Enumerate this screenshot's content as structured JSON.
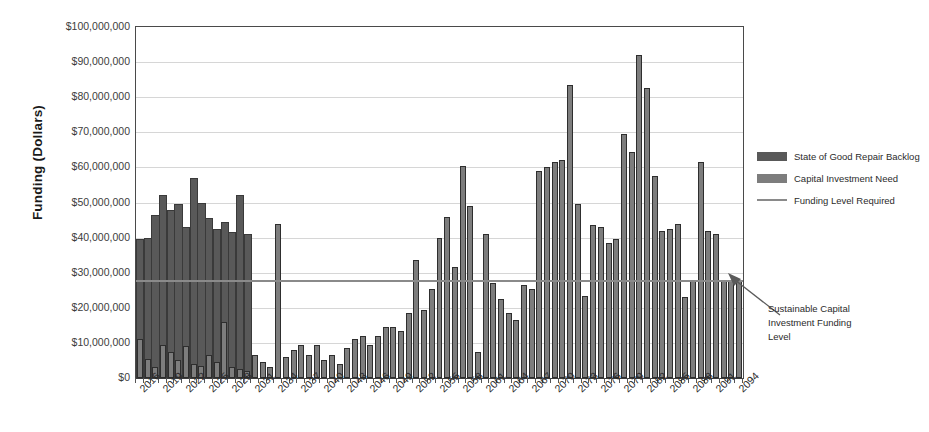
{
  "chart_data": {
    "type": "bar",
    "title": "",
    "xlabel": "",
    "ylabel": "Funding (Dollars)",
    "ylim": [
      0,
      100000000
    ],
    "grid": true,
    "legend_position": "right",
    "y_ticks": [
      "$100,000,000",
      "$90,000,000",
      "$80,000,000",
      "$70,000,000",
      "$60,000,000",
      "$50,000,000",
      "$40,000,000",
      "$30,000,000",
      "$20,000,000",
      "$10,000,000",
      "$0"
    ],
    "y_tick_values": [
      100000000,
      90000000,
      80000000,
      70000000,
      60000000,
      50000000,
      40000000,
      30000000,
      20000000,
      10000000,
      0
    ],
    "x_tick_labels": [
      "2016",
      "2019",
      "2022",
      "2025",
      "2028",
      "2031",
      "2034",
      "2037",
      "2040",
      "2043",
      "2046",
      "2049",
      "2052",
      "2055",
      "2058",
      "2061",
      "2064",
      "2067",
      "2070",
      "2073",
      "2076",
      "2079",
      "2082",
      "2085",
      "2088",
      "2091",
      "2094"
    ],
    "categories": [
      2016,
      2017,
      2018,
      2019,
      2020,
      2021,
      2022,
      2023,
      2024,
      2025,
      2026,
      2027,
      2028,
      2029,
      2030,
      2031,
      2032,
      2033,
      2034,
      2035,
      2036,
      2037,
      2038,
      2039,
      2040,
      2041,
      2042,
      2043,
      2044,
      2045,
      2046,
      2047,
      2048,
      2049,
      2050,
      2051,
      2052,
      2053,
      2054,
      2055,
      2056,
      2057,
      2058,
      2059,
      2060,
      2061,
      2062,
      2063,
      2064,
      2065,
      2066,
      2067,
      2068,
      2069,
      2070,
      2071,
      2072,
      2073,
      2074,
      2075,
      2076,
      2077,
      2078,
      2079,
      2080,
      2081,
      2082,
      2083,
      2084,
      2085,
      2086,
      2087,
      2088,
      2089,
      2090,
      2091,
      2092,
      2093,
      2094
    ],
    "series": [
      {
        "name": "State of Good Repair Backlog",
        "color": "#595959",
        "values": [
          39500000,
          40000000,
          46500000,
          52000000,
          48000000,
          49500000,
          43000000,
          57000000,
          50000000,
          45500000,
          42500000,
          44500000,
          41500000,
          52000000,
          41000000,
          0,
          0,
          0,
          0,
          0,
          0,
          0,
          0,
          0,
          0,
          0,
          0,
          0,
          0,
          0,
          0,
          0,
          0,
          0,
          0,
          0,
          0,
          0,
          0,
          0,
          0,
          0,
          0,
          0,
          0,
          0,
          0,
          0,
          0,
          0,
          0,
          0,
          0,
          0,
          0,
          0,
          0,
          0,
          0,
          0,
          0,
          0,
          0,
          0,
          0,
          0,
          0,
          0,
          0,
          0,
          0,
          0,
          0,
          0,
          0,
          0,
          0,
          0,
          0
        ]
      },
      {
        "name": "Capital Investment Need",
        "color": "#7d7d7d",
        "values": [
          11000000,
          5500000,
          3000000,
          9500000,
          7500000,
          5000000,
          9000000,
          4000000,
          3500000,
          6500000,
          4500000,
          16000000,
          3000000,
          2500000,
          2000000,
          6500000,
          4500000,
          3000000,
          44000000,
          6000000,
          8000000,
          9500000,
          6500000,
          9500000,
          5000000,
          6500000,
          4000000,
          8500000,
          11000000,
          12000000,
          9500000,
          12000000,
          14500000,
          14500000,
          13500000,
          18500000,
          33500000,
          19500000,
          25500000,
          40000000,
          46000000,
          31500000,
          60500000,
          49000000,
          7500000,
          41000000,
          27000000,
          22500000,
          18500000,
          16500000,
          26500000,
          25500000,
          59000000,
          60000000,
          61500000,
          62000000,
          83500000,
          49500000,
          23500000,
          43500000,
          43000000,
          38500000,
          39500000,
          69500000,
          64500000,
          92000000,
          82500000,
          57500000,
          42000000,
          42500000,
          44000000,
          23000000,
          28000000,
          61500000,
          42000000,
          41000000,
          28000000,
          28000000,
          27500000
        ]
      }
    ],
    "reference_line": {
      "name": "Funding Level Required",
      "value": 28000000,
      "color": "#8a8a8a"
    },
    "annotation": {
      "text": "Sustainable Capital Investment Funding Level",
      "lines": [
        "Sustainable Capital",
        "Investment Funding",
        "Level"
      ],
      "points_to_value": 28000000
    }
  },
  "legend": {
    "items": [
      {
        "label": "State of Good Repair Backlog",
        "type": "box",
        "color": "#595959"
      },
      {
        "label": "Capital Investment Need",
        "type": "box",
        "color": "#7d7d7d"
      },
      {
        "label": "Funding Level Required",
        "type": "line",
        "color": "#8a8a8a"
      }
    ]
  },
  "axis": {
    "y_title": "Funding (Dollars)"
  }
}
